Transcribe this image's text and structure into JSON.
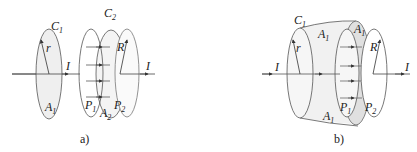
{
  "figure": {
    "panels": [
      {
        "id": "a",
        "caption": "a)",
        "labels": {
          "loop1": "C",
          "loop1_sub": "1",
          "loop2": "C",
          "loop2_sub": "2",
          "radius_small": "r",
          "radius_large": "R",
          "current_in": "I",
          "current_out": "I",
          "area1": "A",
          "area1_sub": "1",
          "area2": "A",
          "area2_sub": "2",
          "plate1": "P",
          "plate1_sub": "1",
          "plate2": "P",
          "plate2_sub": "2"
        }
      },
      {
        "id": "b",
        "caption": "b)",
        "labels": {
          "loop1": "C",
          "loop1_sub": "1",
          "radius_small": "r",
          "radius_large": "R",
          "current_in": "I",
          "current_out": "I",
          "surface_top": "A",
          "surface_top_sub": "1",
          "surface_right": "A",
          "surface_right_sub": "1",
          "surface_bottom": "A",
          "surface_bottom_sub": "1",
          "plate1": "P",
          "plate1_sub": "1",
          "plate2": "P",
          "plate2_sub": "2"
        }
      }
    ],
    "colors": {
      "stroke": "#333333",
      "fill_light": "#efefef",
      "fill_mid": "#e2e2e2"
    }
  }
}
